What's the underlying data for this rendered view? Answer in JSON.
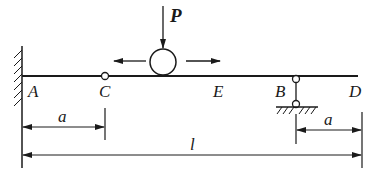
{
  "diagram": {
    "type": "beam-with-moving-load",
    "points": {
      "A": "A",
      "C": "C",
      "E": "E",
      "B": "B",
      "D": "D"
    },
    "load": {
      "label": "P",
      "description": "moving roller load with bidirectional motion arrows"
    },
    "supports": {
      "A": "fixed-wall",
      "C": "internal-hinge",
      "B": "pinned-support"
    },
    "dimensions": {
      "AC": "a",
      "BD": "a",
      "AD": "l"
    },
    "colors": {
      "line": "#1a1a1a",
      "background": "#ffffff"
    }
  }
}
